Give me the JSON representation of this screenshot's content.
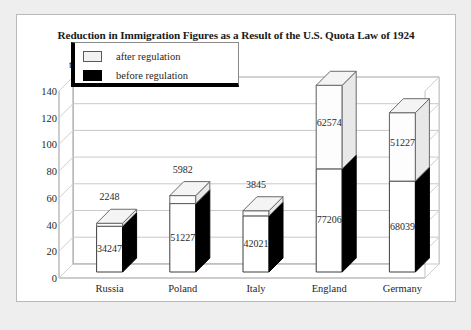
{
  "figure": {
    "title": "Reduction in Immigration Figures as a Result of the U.S. Quota Law of 1924",
    "unit_label": "thousands"
  },
  "legend": {
    "position": "top-left-inside",
    "entries": [
      {
        "label": "after regulation",
        "color": "#f2f2f2",
        "swatch": "light"
      },
      {
        "label": "before regulation",
        "color": "#000000",
        "swatch": "black"
      }
    ]
  },
  "chart_data": {
    "type": "bar",
    "subtype": "stacked-3d-column",
    "title": "Reduction in Immigration Figures as a Result of the U.S. Quota Law of 1924",
    "xlabel": "",
    "ylabel": "thousands",
    "ylim": [
      0,
      140
    ],
    "yticks": [
      0,
      20,
      40,
      60,
      80,
      100,
      120,
      140
    ],
    "ytick_labels": [
      "0",
      "20",
      "40",
      "60",
      "80",
      "100",
      "120",
      "140"
    ],
    "grid": true,
    "units": "thousands",
    "categories": [
      "Russia",
      "Poland",
      "Italy",
      "England",
      "Germany"
    ],
    "series": [
      {
        "name": "before regulation",
        "color": "#000000",
        "values": [
          34247,
          51227,
          42021,
          77206,
          68039
        ],
        "values_thousands": [
          34.247,
          51.227,
          42.021,
          77.206,
          68.039
        ],
        "data_labels": [
          "34247",
          "51227",
          "42021",
          "77206",
          "68039"
        ]
      },
      {
        "name": "after regulation",
        "color": "#f2f2f2",
        "values": [
          2248,
          5982,
          3845,
          62574,
          51227
        ],
        "values_thousands": [
          2.248,
          5.982,
          3.845,
          62.574,
          51.227
        ],
        "data_labels": [
          "2248",
          "5982",
          "3845",
          "62574",
          "51227"
        ]
      }
    ],
    "totals": [
      36495,
      57209,
      45866,
      139780,
      119266
    ],
    "totals_thousands": [
      36.495,
      57.209,
      45.866,
      139.78,
      119.266
    ]
  },
  "colors": {
    "page_background": "#eeeeee",
    "panel_background": "#ffffff",
    "panel_border": "#b9b9b9",
    "grid": "#c7c7c7",
    "axis": "#8e8e8e",
    "text": "#1f1f1f",
    "before_fill": "#000000",
    "after_fill": "#f2f2f2"
  }
}
